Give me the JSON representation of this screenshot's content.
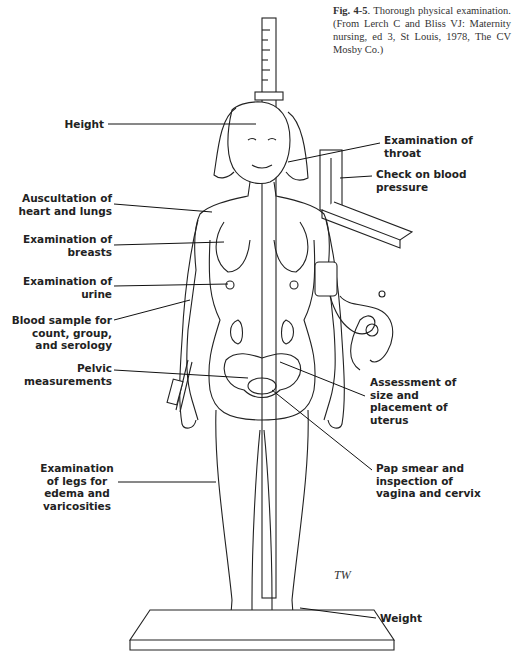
{
  "caption": {
    "figure_number": "Fig. 4-5",
    "text": ". Thorough physical examination. (From Lerch C and Bliss VJ: Maternity nursing, ed 3, St Louis, 1978, The CV Mosby Co.)"
  },
  "labels_left": {
    "height": "Height",
    "auscultation": "Auscultation of heart and lungs",
    "breasts": "Examination of breasts",
    "urine": "Examination of urine",
    "blood": "Blood sample for count, group, and serology",
    "pelvic": "Pelvic measurements",
    "legs": "Examination of legs for edema and varicosities"
  },
  "labels_right": {
    "throat": "Examination of throat",
    "blood_pressure": "Check on blood pressure",
    "uterus": "Assessment of size and placement of uterus",
    "pap": "Pap smear and inspection of vagina and cervix",
    "weight": "Weight"
  },
  "signature": "TW"
}
